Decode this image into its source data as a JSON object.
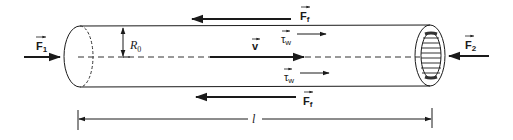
{
  "diagram": {
    "labels": {
      "F1": {
        "base": "F",
        "sub": "1",
        "vector": true
      },
      "F2": {
        "base": "F",
        "sub": "2",
        "vector": true
      },
      "Ff_top": {
        "base": "F",
        "sub": "f",
        "vector": true
      },
      "Ff_bottom": {
        "base": "F",
        "sub": "f",
        "vector": true
      },
      "tau_top": {
        "base": "τ",
        "sub": "w",
        "vector": true
      },
      "tau_bottom": {
        "base": "τ",
        "sub": "w",
        "vector": true
      },
      "v": {
        "base": "v",
        "vector": true
      },
      "R0": {
        "base": "R",
        "sub": "0"
      },
      "l": {
        "base": "l"
      }
    },
    "colors": {
      "stroke": "#1a1a1a",
      "background": "#ffffff"
    }
  }
}
